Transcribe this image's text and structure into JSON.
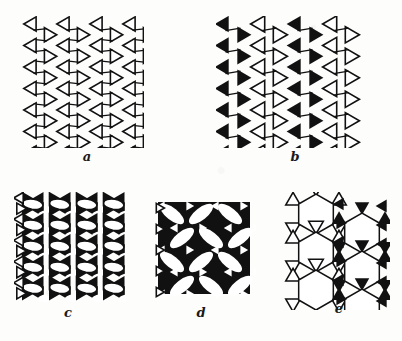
{
  "figure": {
    "background_color": "#fdfdfc",
    "ink_color": "#111111",
    "paper_color": "#ffffff",
    "caption_style": "handwritten italic lowercase letters",
    "panel_count": 5
  },
  "panels": [
    {
      "id": "a",
      "label": "a",
      "description": "Kagome-type net of outlined (hollow) triangles meeting point-to-point around white hexagonal holes",
      "triangle_fill": "hollow",
      "hole_shape": "hexagon",
      "columns": 4,
      "rows": 6
    },
    {
      "id": "b",
      "label": "b",
      "description": "Alternating vertical bands of solid black triangles and hollow outlined triangles around hexagonal holes",
      "triangle_fill": "alternating solid and hollow",
      "hole_shape": "hexagon",
      "columns": 4,
      "rows": 6
    },
    {
      "id": "c",
      "label": "c",
      "description": "Dense array of solid black triangles forming bowties with narrow white lens-shaped voids; hollow triangles along the left margin",
      "triangle_fill": "solid with hollow left column",
      "hole_shape": "lens",
      "columns": 4,
      "rows": 5
    },
    {
      "id": "d",
      "label": "d",
      "description": "Black ground pierced by large tilted white lens shapes and small triangular white notches",
      "triangle_fill": "solid",
      "hole_shape": "tilted lens",
      "columns": 3,
      "rows": 4
    },
    {
      "id": "e",
      "label": "e",
      "description": "Large white hexagons ringed by solid black triangles, with hollow outlined triangles forming a star band at the left",
      "triangle_fill": "solid with hollow left column",
      "hole_shape": "large hexagon",
      "columns": 2,
      "rows": 3
    }
  ],
  "labels": {
    "a": "a",
    "b": "b",
    "c": "c",
    "d": "d",
    "e": "e"
  }
}
